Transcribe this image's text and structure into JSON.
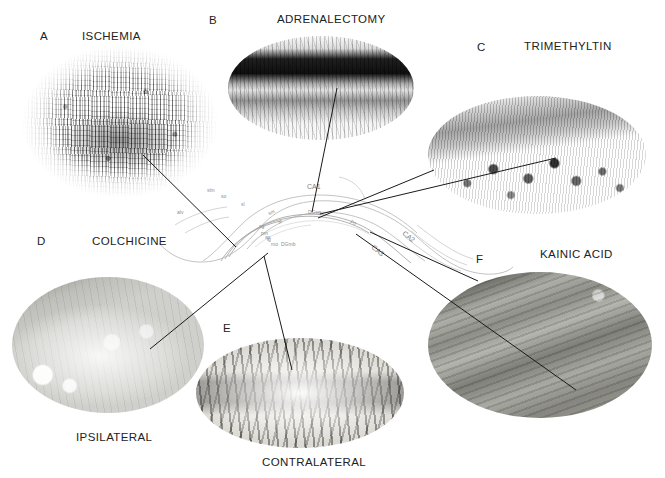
{
  "figure": {
    "background": "#ffffff",
    "line_color": "#1a1a1a"
  },
  "panels": [
    {
      "id": "A",
      "letter": "A",
      "title": "ISCHEMIA",
      "caption": "",
      "shape": "ellipse",
      "description": "dense stippled dark-speckled micrograph with granular cell band"
    },
    {
      "id": "B",
      "letter": "B",
      "title": "ADRENALECTOMY",
      "caption": "",
      "shape": "ellipse",
      "description": "horizontal dark band over lighter laminated tissue"
    },
    {
      "id": "C",
      "letter": "C",
      "title": "TRIMETHYLTIN",
      "caption": "",
      "shape": "ellipse",
      "description": "granular layer band with scattered large dark reactive cells"
    },
    {
      "id": "D",
      "letter": "D",
      "title": "COLCHICINE",
      "caption": "IPSILATERAL",
      "shape": "ellipse",
      "description": "pale field with sparse dark stellate stained neurons"
    },
    {
      "id": "E",
      "letter": "E",
      "title": "",
      "caption": "CONTRALATERAL",
      "shape": "ellipse",
      "description": "horizontal row of dark stained neurons across pale oval"
    },
    {
      "id": "F",
      "letter": "F",
      "title": "KAINIC ACID",
      "caption": "",
      "shape": "ellipse",
      "description": "diagonally banded laminated grey tissue"
    }
  ],
  "schematic": {
    "name": "hippocampus-line-drawing",
    "region_labels": [
      {
        "text": "CA1",
        "size": "big"
      },
      {
        "text": "CA2",
        "size": "big"
      },
      {
        "text": "CA3",
        "size": "big"
      },
      {
        "text": "DGsg",
        "size": "small"
      },
      {
        "text": "DGmb",
        "size": "small"
      },
      {
        "text": "sm",
        "size": "small"
      },
      {
        "text": "sr",
        "size": "small"
      },
      {
        "text": "sp",
        "size": "small"
      },
      {
        "text": "so",
        "size": "small"
      },
      {
        "text": "slm",
        "size": "small"
      },
      {
        "text": "mo",
        "size": "small"
      },
      {
        "text": "sg",
        "size": "small"
      },
      {
        "text": "pm",
        "size": "small"
      },
      {
        "text": "lg",
        "size": "small"
      },
      {
        "text": "alv",
        "size": "small"
      },
      {
        "text": "po",
        "size": "small"
      },
      {
        "text": "sl",
        "size": "small"
      }
    ]
  }
}
